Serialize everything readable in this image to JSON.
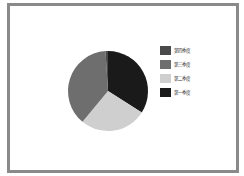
{
  "chart_data": {
    "type": "pie",
    "title": "",
    "categories": [
      "第一季度",
      "第二季度",
      "第三季度",
      "第四季度"
    ],
    "values": [
      34,
      27,
      38,
      1
    ],
    "colors": [
      "#1a1a1a",
      "#cfcfcf",
      "#6e6e6e",
      "#4a4a4a"
    ],
    "legend": {
      "position": "right",
      "order": [
        "第四季度",
        "第三季度",
        "第二季度",
        "第一季度"
      ]
    },
    "start_angle_deg": 0,
    "direction": "clockwise"
  },
  "legend_items": [
    {
      "label": "第四季度",
      "color": "#4a4a4a"
    },
    {
      "label": "第三季度",
      "color": "#6e6e6e"
    },
    {
      "label": "第二季度",
      "color": "#cfcfcf"
    },
    {
      "label": "第一季度",
      "color": "#1a1a1a"
    }
  ]
}
